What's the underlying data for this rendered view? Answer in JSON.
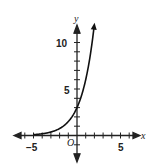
{
  "chart_data": {
    "type": "line",
    "title": "",
    "xlabel": "x",
    "ylabel": "y",
    "origin_label": "O",
    "x_tick_labels": [
      "-5",
      "5"
    ],
    "y_tick_labels": [
      "5",
      "10"
    ],
    "xlim": [
      -7,
      7
    ],
    "ylim": [
      -2.5,
      12
    ],
    "grid": false,
    "series": [
      {
        "name": "exponential curve",
        "description": "y ≈ 3·2^x, approaches 0 as x→-∞, y-intercept ≈ 3",
        "x": [
          -5,
          -4,
          -3,
          -2,
          -1,
          0,
          1,
          1.5,
          1.9
        ],
        "values": [
          0.09,
          0.19,
          0.38,
          0.75,
          1.5,
          3,
          6,
          8.5,
          11.2
        ]
      }
    ]
  },
  "labels": {
    "x_axis": "x",
    "y_axis": "y",
    "origin": "O",
    "x_neg5": "−5",
    "x_pos5": "5",
    "y_5": "5",
    "y_10": "10"
  }
}
